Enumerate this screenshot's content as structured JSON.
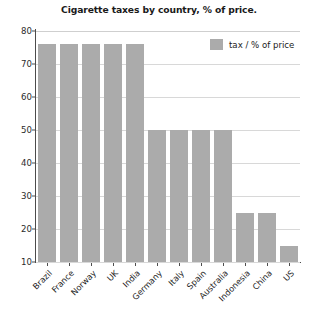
{
  "chart_data": {
    "type": "bar",
    "title": "Cigarette taxes by country, % of price.",
    "xlabel": "",
    "ylabel": "",
    "ylim": [
      10,
      80
    ],
    "yticks": [
      10,
      20,
      30,
      40,
      50,
      60,
      70,
      80
    ],
    "grid": true,
    "legend_position": "top-right",
    "categories": [
      "Brazil",
      "France",
      "Norway",
      "UK",
      "India",
      "Germany",
      "Italy",
      "Spain",
      "Australia",
      "Indonesia",
      "China",
      "US"
    ],
    "series": [
      {
        "name": "tax / % of price",
        "color": "#ababab",
        "values": [
          76,
          76,
          76,
          76,
          76,
          50,
          50,
          50,
          50,
          25,
          25,
          15
        ]
      }
    ]
  },
  "legend": {
    "entries": [
      {
        "label": "tax / % of price",
        "color": "#ababab"
      }
    ]
  },
  "style": {
    "bar_color": "#ababab",
    "axis_color": "#4c4c4c",
    "grid_color": "#d8d8d8",
    "text_color": "#1a1a1a",
    "background": "#ffffff"
  }
}
